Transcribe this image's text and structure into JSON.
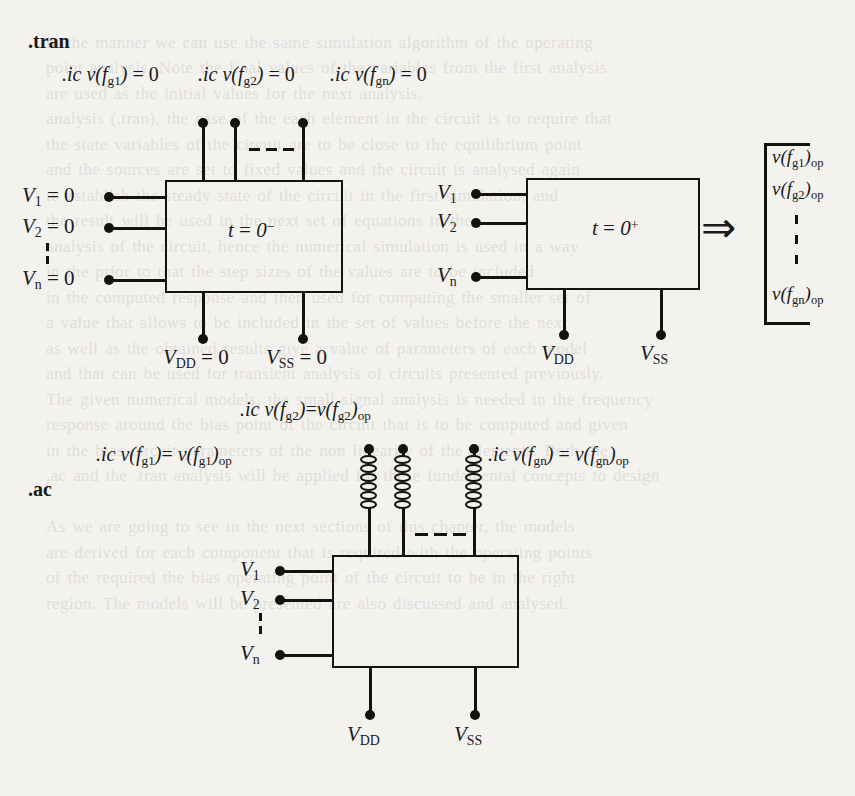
{
  "page": {
    "bleed_text": "                                                                                  \n   in the manner we can use the same simulation algorithm of the operating\n   point analysis. Note the final values of the variables from the first analysis\n   are used as the initial values for the next analysis.\n   analysis (.tran), the case of the each element in the circuit is to require that\n   the state variables of the circuit are to be close to the equilibrium point\n   and the sources are set to fixed values and the circuit is analysed again\n   to establish the steady state of the circuit in the first simulation, and\n   the result will be used in the next set of equations in the\n   analysis of the circuit, hence the numerical simulation is used in a way\n   in the prior to that the step sizes of the values are to be included\n   in the computed response and then used for computing the smaller set of\n   a value that allows to be included in the set of values before the next\n   as well as the obtained results give a value of parameters of each model\n   and that can be used for transient analysis of circuits presented previously.\n   The given numerical models, the small signal analysis is needed in the frequency\n   response around the bias point of the circuit that is to be computed and given\n   in the bias circuit parameters of the non linearity of the elements. Both the\n   .ac and the .tran analysis will be applied for these fundamental concepts to design\n\n   As we are going to see in the next sections of this chapter, the models\n   are derived for each component that is required with the operating points\n   of the required the bias operating point of the circuit to be in the right\n   region. The models will be presented are also discussed and analysed."
  },
  "tran_section": {
    "label": ".tran",
    "ic_line": [
      {
        "id": "tran-ic-1",
        "prefix": ".ic",
        "var": "v(f",
        "sub": "g1",
        "close": ")",
        "eq": "= 0"
      },
      {
        "id": "tran-ic-2",
        "prefix": ".ic",
        "var": "v(f",
        "sub": "g2",
        "close": ")",
        "eq": "= 0"
      },
      {
        "id": "tran-ic-3",
        "prefix": ".ic",
        "var": "v(f",
        "sub": "gn",
        "close": ")",
        "eq": "= 0"
      }
    ],
    "left_block": {
      "label_t": "t",
      "label_eq": "= 0",
      "label_sup": "−",
      "inputs": [
        {
          "v": "V",
          "sub": "1",
          "value": "= 0"
        },
        {
          "v": "V",
          "sub": "2",
          "value": "= 0"
        },
        {
          "v": "V",
          "sub": "n",
          "value": "= 0"
        }
      ],
      "supplies": [
        {
          "v": "V",
          "sub": "DD",
          "value": "= 0"
        },
        {
          "v": "V",
          "sub": "SS",
          "value": "= 0"
        }
      ],
      "top_terminals": 3
    },
    "right_block": {
      "label_t": "t",
      "label_eq": "= 0",
      "label_sup": "+",
      "inputs": [
        {
          "v": "V",
          "sub": "1",
          "value": ""
        },
        {
          "v": "V",
          "sub": "2",
          "value": ""
        },
        {
          "v": "V",
          "sub": "n",
          "value": ""
        }
      ],
      "supplies": [
        {
          "v": "V",
          "sub": "DD",
          "value": ""
        },
        {
          "v": "V",
          "sub": "SS",
          "value": ""
        }
      ]
    },
    "implies_arrow": "⇒",
    "results_bracket": [
      {
        "var": "v(f",
        "sub": "g1",
        "close": ")",
        "post": "op"
      },
      {
        "var": "v(f",
        "sub": "g2",
        "close": ")",
        "post": "op"
      },
      {
        "var": "v(f",
        "sub": "gn",
        "close": ")",
        "post": "op"
      }
    ]
  },
  "ac_section": {
    "label": ".ac",
    "ic_equations": [
      {
        "id": "ac-ic-g2",
        "prefix": ".ic",
        "var": "v(f",
        "sub": "g2",
        "close": ")",
        "eq": "=",
        "rhs_var": "v(f",
        "rhs_sub": "g2",
        "rhs_close": ")",
        "rhs_post": "op"
      },
      {
        "id": "ac-ic-g1",
        "prefix": ".ic",
        "var": "v(f",
        "sub": "g1",
        "close": ")",
        "eq": "=",
        "rhs_var": "v(f",
        "rhs_sub": "g1",
        "rhs_close": ")",
        "rhs_post": "op"
      },
      {
        "id": "ac-ic-gn",
        "prefix": ".ic",
        "var": "v(f",
        "sub": "gn",
        "close": ")",
        "eq": "=",
        "rhs_var": "v(f",
        "rhs_sub": "gn",
        "rhs_close": ")",
        "rhs_post": "op"
      }
    ],
    "block": {
      "inputs": [
        {
          "v": "V",
          "sub": "1",
          "value": ""
        },
        {
          "v": "V",
          "sub": "2",
          "value": ""
        },
        {
          "v": "V",
          "sub": "n",
          "value": ""
        }
      ],
      "supplies": [
        {
          "v": "V",
          "sub": "DD",
          "value": ""
        },
        {
          "v": "V",
          "sub": "SS",
          "value": ""
        }
      ],
      "inductors": 3,
      "inductor_turns": 6
    }
  },
  "colors": {
    "ink": "#14120f",
    "paper": "#f3f2ef"
  }
}
